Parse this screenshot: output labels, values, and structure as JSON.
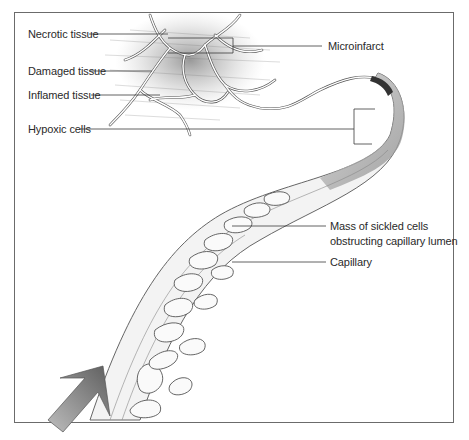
{
  "figure": {
    "labels": {
      "necrotic_tissue": "Necrotic tissue",
      "damaged_tissue": "Damaged tissue",
      "inflamed_tissue": "Inflamed tissue",
      "hypoxic_cells": "Hypoxic cells",
      "microinfarct": "Microinfarct",
      "mass_line1": "Mass of sickled cells",
      "mass_line2": "obstructing capillary lumen",
      "capillary": "Capillary"
    },
    "components": [
      "tissue-network",
      "capillary-tube",
      "sickled-cells-mass",
      "blood-flow-arrow"
    ],
    "colors": {
      "frame": "#6b6b6b",
      "leader_line": "#3a3a3a",
      "text": "#2a2a2a",
      "shading": "#8a8a8a",
      "arrow": "#7a7a7a"
    }
  }
}
